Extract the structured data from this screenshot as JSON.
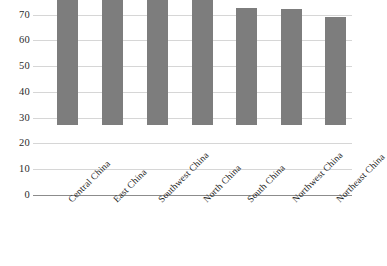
{
  "chart_data": {
    "type": "bar",
    "title": "",
    "subtitle": "",
    "xlabel": "",
    "ylabel": "",
    "categories": [
      "Central China",
      "East China",
      "Southwest China",
      "North China",
      "South China",
      "Northwest China",
      "Northeast China"
    ],
    "values": [
      65,
      53.5,
      53.5,
      49.5,
      45.5,
      45,
      42
    ],
    "ylim": [
      0,
      70
    ],
    "ytick_labels": [
      "0",
      "10",
      "20",
      "30",
      "40",
      "50",
      "60",
      "70"
    ],
    "ytick_values": [
      0,
      10,
      20,
      30,
      40,
      50,
      60,
      70
    ],
    "grid": "horizontal",
    "legend": "none",
    "series": [
      {
        "name": "",
        "values": [
          65,
          53.5,
          53.5,
          49.5,
          45.5,
          45,
          42
        ],
        "color": "#7d7d7d"
      }
    ],
    "colors": {
      "bar": "#7d7d7d",
      "gridline": "#d6d6d6",
      "axis": "#8c8c8c",
      "text": "#2b2b2b",
      "background": "#ffffff"
    },
    "xtick_rotation": -45
  }
}
